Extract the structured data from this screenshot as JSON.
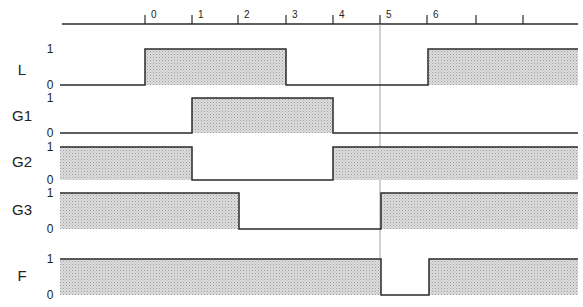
{
  "diagram": {
    "type": "timing-diagram",
    "time_axis": {
      "y": 24,
      "x_start": 62,
      "x_end": 578,
      "ticks": [
        {
          "x": 145,
          "label": "0"
        },
        {
          "x": 192,
          "label": "1"
        },
        {
          "x": 238,
          "label": "2"
        },
        {
          "x": 286,
          "label": "3"
        },
        {
          "x": 333,
          "label": "4"
        },
        {
          "x": 380,
          "label": "5"
        },
        {
          "x": 427,
          "label": "6"
        },
        {
          "x": 476,
          "label": ""
        },
        {
          "x": 523,
          "label": ""
        }
      ]
    },
    "marker_line": {
      "x": 380,
      "y_top": 24,
      "y_bottom": 262
    },
    "colors": {
      "line": "#2a2a2a",
      "fill": "#cfcfcf",
      "marker": "#8a8a8a"
    },
    "signals": [
      {
        "name": "L",
        "label_y": 75,
        "high_y": 49,
        "low_y": 85,
        "high_label": "1",
        "low_label": "0",
        "segments": [
          [
            60,
            145,
            0
          ],
          [
            145,
            286,
            1
          ],
          [
            286,
            428,
            0
          ],
          [
            428,
            578,
            1
          ]
        ]
      },
      {
        "name": "G1",
        "label_y": 121,
        "high_y": 98,
        "low_y": 133,
        "high_label": "1",
        "low_label": "0",
        "segments": [
          [
            60,
            192,
            0
          ],
          [
            192,
            333,
            1
          ],
          [
            333,
            578,
            0
          ]
        ]
      },
      {
        "name": "G2",
        "label_y": 167,
        "high_y": 147,
        "low_y": 180,
        "high_label": "1",
        "low_label": "0",
        "segments": [
          [
            60,
            192,
            1
          ],
          [
            192,
            333,
            0
          ],
          [
            333,
            578,
            1
          ]
        ]
      },
      {
        "name": "G3",
        "label_y": 215,
        "high_y": 193,
        "low_y": 229,
        "high_label": "1",
        "low_label": "0",
        "segments": [
          [
            60,
            239,
            1
          ],
          [
            239,
            381,
            0
          ],
          [
            381,
            578,
            1
          ]
        ]
      },
      {
        "name": "F",
        "label_y": 281,
        "high_y": 259,
        "low_y": 295,
        "high_label": "1",
        "low_label": "0",
        "segments": [
          [
            60,
            381,
            1
          ],
          [
            381,
            429,
            0
          ],
          [
            429,
            578,
            1
          ]
        ]
      }
    ]
  }
}
